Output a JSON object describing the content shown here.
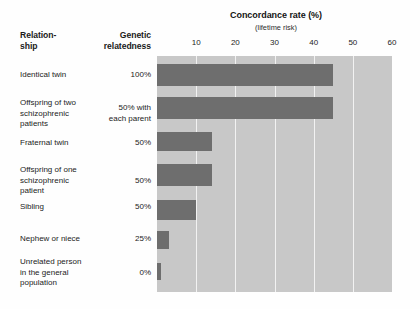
{
  "header": {
    "relationship_label": "Relation-\nship",
    "relatedness_label": "Genetic\nrelatedness"
  },
  "chart_data": {
    "type": "bar",
    "orientation": "horizontal",
    "title": "Concordance rate (%)",
    "subtitle": "(lifetime risk)",
    "xlabel": "Concordance rate (%)",
    "ylabel": "Relationship",
    "xlim": [
      0,
      60
    ],
    "xticks": [
      10,
      20,
      30,
      40,
      50,
      60
    ],
    "grid": true,
    "legend": "none",
    "categories": [
      "Identical twin",
      "Offspring of two schizophrenic patients",
      "Fraternal twin",
      "Offspring of one schizophrenic patient",
      "Sibling",
      "Nephew or niece",
      "Unrelated person in the general population"
    ],
    "values": [
      45,
      45,
      14,
      14,
      10,
      3,
      1
    ],
    "genetic_relatedness": [
      "100%",
      "50% with each parent",
      "50%",
      "50%",
      "50%",
      "25%",
      "0%"
    ],
    "colors": {
      "bar": "#6e6e6e",
      "plot_background": "#c8c8c8",
      "gridline": "#f2f2f2",
      "text": "#232323"
    }
  },
  "rows": [
    {
      "label": "Identical twin",
      "relatedness": "100%",
      "value": 45
    },
    {
      "label": "Offspring of two schizophrenic patients",
      "relatedness": "50% with each parent",
      "value": 45
    },
    {
      "label": "Fraternal twin",
      "relatedness": "50%",
      "value": 14
    },
    {
      "label": "Offspring of one schizophrenic patient",
      "relatedness": "50%",
      "value": 14
    },
    {
      "label": "Sibling",
      "relatedness": "50%",
      "value": 10
    },
    {
      "label": "Nephew or niece",
      "relatedness": "25%",
      "value": 3
    },
    {
      "label": "Unrelated person in the general population",
      "relatedness": "0%",
      "value": 1
    }
  ],
  "row_label_lines": [
    [
      "Identical twin"
    ],
    [
      "Offspring of two",
      "schizophrenic",
      "patients"
    ],
    [
      "Fraternal twin"
    ],
    [
      "Offspring of one",
      "schizophrenic",
      "patient"
    ],
    [
      "Sibling"
    ],
    [
      "Nephew or niece"
    ],
    [
      "Unrelated person",
      "in the general",
      "population"
    ]
  ],
  "row_value_lines": [
    [
      "100%"
    ],
    [
      "50% with",
      "each parent"
    ],
    [
      "50%"
    ],
    [
      "50%"
    ],
    [
      "50%"
    ],
    [
      "25%"
    ],
    [
      "0%"
    ]
  ],
  "geometry": {
    "plot_left": 157,
    "plot_top": 56,
    "plot_width": 235,
    "plot_height": 236,
    "px_per_unit": 3.92,
    "row_tops": [
      63,
      96,
      131,
      163,
      199,
      230,
      262
    ],
    "row_bar_tops": [
      8,
      41,
      76,
      108,
      144,
      175,
      207
    ],
    "bar_heights": [
      22,
      22,
      19,
      22,
      20,
      18,
      17
    ],
    "label_tops": [
      70,
      98,
      138,
      165,
      202,
      234,
      257
    ]
  }
}
